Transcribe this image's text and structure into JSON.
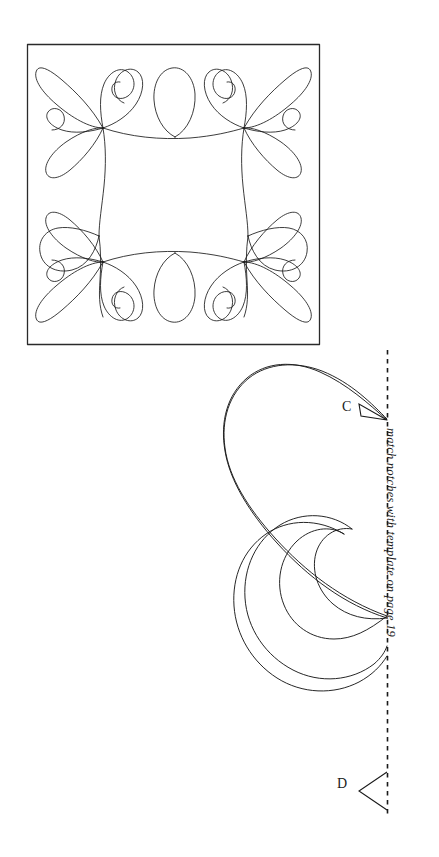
{
  "page": {
    "background_color": "#ffffff",
    "ink_color": "#1a1a1a",
    "width": 439,
    "height": 857
  },
  "block_diagram": {
    "name": "quilting-block-feather-border",
    "frame": {
      "x": 27,
      "y": 44,
      "width": 293,
      "height": 301
    },
    "description": "Square quilt block outline containing a continuous-line feather border motif with scrolled corner plumes and teardrop petals"
  },
  "template_piece": {
    "name": "feather-plume-template",
    "description": "Half feather plume template piece with spiral tail, to be traced against the fold line"
  },
  "fold_line": {
    "label": "fold / match line",
    "x": 387,
    "y_start": 350,
    "y_end": 816,
    "style": "dashed"
  },
  "caption": {
    "text": "match notches with template on page 19",
    "rotation_degrees": 90,
    "style": "italic"
  },
  "notches": [
    {
      "id": "c",
      "label": "C",
      "x": 387,
      "y": 419
    },
    {
      "id": "d",
      "label": "D",
      "x": 387,
      "y": 790
    }
  ]
}
